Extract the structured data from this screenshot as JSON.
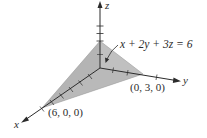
{
  "diagram": {
    "equation_label": "x + 2y + 3z = 6",
    "axes": {
      "x": {
        "label": "x"
      },
      "y": {
        "label": "y"
      },
      "z": {
        "label": "z"
      }
    },
    "points": [
      {
        "label": "(6, 0, 0)",
        "coords": [
          6,
          0,
          0
        ]
      },
      {
        "label": "(0, 3, 0)",
        "coords": [
          0,
          3,
          0
        ]
      },
      {
        "label": "z-intercept",
        "coords": [
          0,
          0,
          2
        ]
      }
    ],
    "point_labels": {
      "x_intercept": "(6, 0, 0)",
      "y_intercept": "(0, 3, 0)"
    },
    "colors": {
      "axis": "#2b2b2b",
      "plane_front": "#b9b9b9",
      "plane_left": "#a9a9a9",
      "plane_floor": "#cfcfcf",
      "text": "#2b2b2b"
    }
  }
}
